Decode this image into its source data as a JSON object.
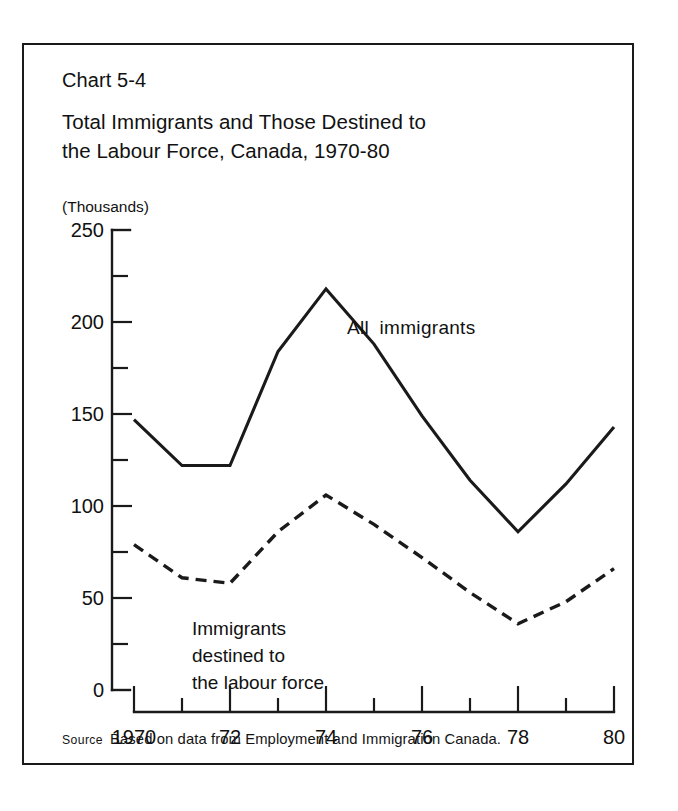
{
  "chart_number": "Chart 5-4",
  "title": "Total Immigrants and Those Destined to\nthe Labour Force, Canada, 1970-80",
  "units_label": "(Thousands)",
  "source": {
    "keyword": "Source",
    "text": "Based on data from Employment and Immigration Canada."
  },
  "annotations": {
    "series1_label": "All  immigrants",
    "series2_label_line1": "Immigrants",
    "series2_label_line2": "destined to",
    "series2_label_line3": "the labour force"
  },
  "axis": {
    "y_tick_labels": [
      "250",
      "200",
      "150",
      "100",
      "50",
      "0"
    ],
    "x_tick_labels": [
      "1970",
      "72",
      "74",
      "76",
      "78",
      "80"
    ]
  },
  "chart_data": {
    "type": "line",
    "title": "Total Immigrants and Those Destined to the Labour Force, Canada, 1970-80",
    "xlabel": "",
    "ylabel": "(Thousands)",
    "x": [
      1970,
      1971,
      1972,
      1973,
      1974,
      1975,
      1976,
      1977,
      1978,
      1979,
      1980
    ],
    "xlim": [
      1970,
      1980
    ],
    "ylim": [
      0,
      250
    ],
    "y_major_ticks": [
      0,
      50,
      100,
      150,
      200,
      250
    ],
    "y_minor_ticks": [
      25,
      75,
      125,
      175,
      225
    ],
    "x_major_ticks": [
      1970,
      1972,
      1974,
      1976,
      1978,
      1980
    ],
    "grid": false,
    "legend": "inline-annotations",
    "series": [
      {
        "name": "All immigrants",
        "style": "solid",
        "values": [
          147,
          122,
          122,
          184,
          218,
          188,
          149,
          114,
          86,
          112,
          143
        ]
      },
      {
        "name": "Immigrants destined to the labour force",
        "style": "dashed",
        "values": [
          79,
          61,
          58,
          86,
          106,
          90,
          72,
          53,
          36,
          48,
          66
        ]
      }
    ]
  }
}
